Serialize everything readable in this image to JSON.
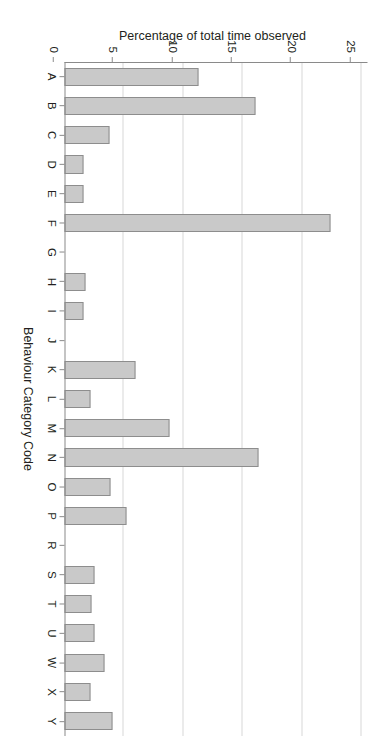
{
  "chart_data": {
    "type": "bar",
    "title": "",
    "xlabel": "Behaviour Category Code",
    "ylabel": "Percentage of total time observed",
    "categories": [
      "A",
      "B",
      "C",
      "D",
      "E",
      "F",
      "G",
      "H",
      "I",
      "J",
      "K",
      "L",
      "M",
      "N",
      "O",
      "P",
      "R",
      "S",
      "T",
      "U",
      "W",
      "X",
      "Y"
    ],
    "values": [
      11.3,
      16.1,
      3.8,
      1.6,
      1.6,
      22.4,
      0,
      1.8,
      1.6,
      0,
      6.0,
      2.2,
      8.8,
      16.3,
      3.9,
      5.2,
      0,
      2.5,
      2.3,
      2.5,
      3.4,
      2.2,
      4.0
    ],
    "ylim": [
      0,
      25
    ],
    "yticks": [
      0,
      5,
      10,
      15,
      20,
      25
    ],
    "ytick_labels": [
      "0",
      "5",
      "10",
      "15",
      "20",
      "25"
    ],
    "grid": true,
    "grid_axis": "y",
    "legend": false,
    "bar_fill": "#c9c9c9",
    "bar_edge": "#8d8d8d",
    "axis_color": "#8a8a8a",
    "grid_color": "#d8d8d8",
    "text_color": "#231f20"
  }
}
